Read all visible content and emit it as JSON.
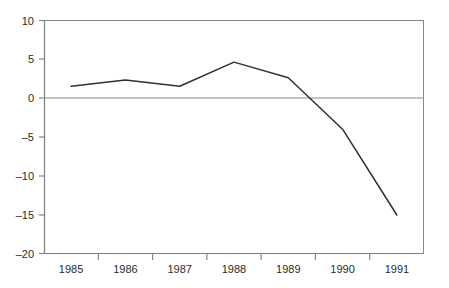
{
  "chart_data": {
    "type": "line",
    "title": "",
    "subtitle": "",
    "xlabel": "",
    "ylabel": "",
    "categories": [
      "1985",
      "1986",
      "1987",
      "1988",
      "1989",
      "1990",
      "1991"
    ],
    "series": [
      {
        "name": "series-1",
        "values": [
          1.5,
          2.3,
          1.5,
          4.6,
          2.6,
          -4.0,
          -15.0
        ],
        "color": "#303030"
      }
    ],
    "ylim": [
      -20,
      10
    ],
    "yticks": [
      10,
      5,
      0,
      -5,
      -10,
      -15,
      -20
    ],
    "ytick_labels": [
      "10",
      "5",
      "0",
      "–5",
      "–10",
      "–15",
      "–20"
    ],
    "xtick_labels": [
      "1985",
      "1986",
      "1987",
      "1988",
      "1989",
      "1990",
      "1991"
    ],
    "grid": false,
    "zero_line": true,
    "legend": "none",
    "legend_position": "none",
    "annotations": []
  },
  "axes": {
    "y_axis_name": "y-axis",
    "x_axis_name": "x-axis",
    "zero_reference": "0"
  },
  "colors": {
    "series_line": "#303030",
    "axis": "#7d7d7d",
    "frame": "#8a8a8a",
    "text": "#2b2b2b",
    "background": "#ffffff"
  }
}
